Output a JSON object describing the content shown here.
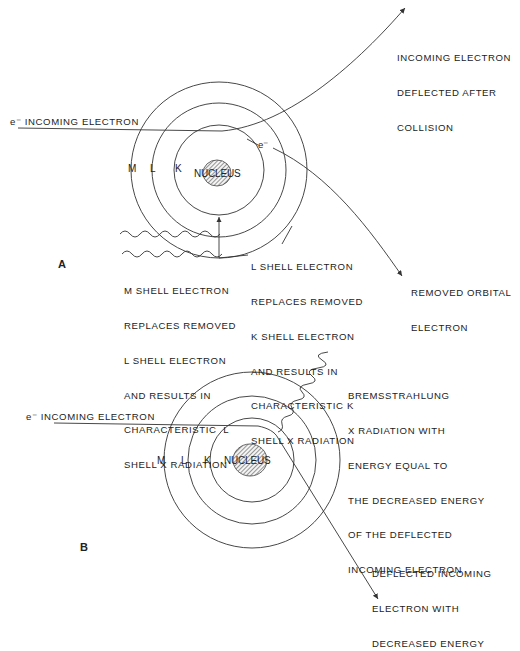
{
  "panel_a": {
    "label": "A",
    "incoming": "e⁻ INCOMING ELECTRON",
    "deflected": [
      "INCOMING ELECTRON",
      "DEFLECTED AFTER",
      "COLLISION"
    ],
    "orbital_e": "e⁻",
    "removed": [
      "REMOVED ORBITAL",
      "ELECTRON"
    ],
    "shells": {
      "m": "M",
      "l": "L",
      "k": "K"
    },
    "nucleus": "NUCLEUS",
    "l_to_k": [
      "L SHELL ELECTRON",
      "REPLACES REMOVED",
      "K SHELL ELECTRON",
      "AND RESULTS IN",
      "CHARACTERISTIC K",
      "SHELL X RADIATION"
    ],
    "m_to_l": [
      "M SHELL ELECTRON",
      "REPLACES REMOVED",
      "L SHELL ELECTRON",
      "AND RESULTS IN",
      "CHARACTERISTIC  L",
      "SHELL X RADIATION"
    ]
  },
  "panel_b": {
    "label": "B",
    "incoming": "e⁻ INCOMING ELECTRON",
    "shells": {
      "m": "M",
      "l": "L",
      "k": "K"
    },
    "nucleus": "NUCLEUS",
    "bremsstrahlung": [
      "BREMSSTRAHLUNG",
      "X RADIATION WITH",
      "ENERGY EQUAL TO",
      "THE DECREASED ENERGY",
      "OF THE DEFLECTED",
      "INCOMING ELECTRON"
    ],
    "deflected": [
      "DEFLECTED INCOMING",
      "ELECTRON WITH",
      "DECREASED ENERGY"
    ]
  },
  "colors": {
    "line": "#333333",
    "hatch": "#555555"
  }
}
